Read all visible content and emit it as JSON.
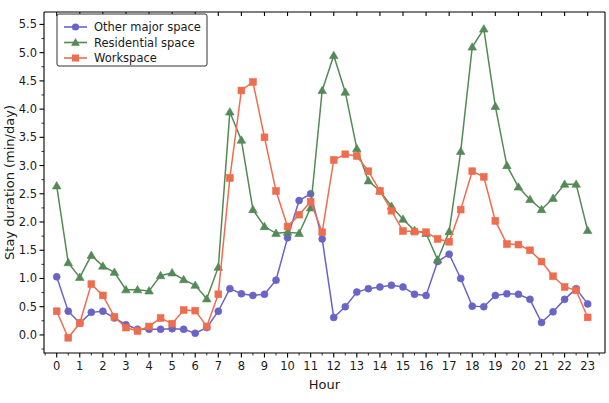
{
  "chart_data": {
    "type": "line",
    "title": "",
    "xlabel": "Hour",
    "ylabel": "Stay duration (min/day)",
    "xlim": [
      -0.55,
      23.75
    ],
    "ylim": [
      -0.32,
      5.72
    ],
    "grid": false,
    "legend_position": "upper left",
    "xticks": [
      0,
      1,
      2,
      3,
      4,
      5,
      6,
      7,
      8,
      9,
      10,
      11,
      12,
      13,
      14,
      15,
      16,
      17,
      18,
      19,
      20,
      21,
      22,
      23
    ],
    "xtick_labels": [
      "0",
      "1",
      "2",
      "3",
      "4",
      "5",
      "6",
      "7",
      "8",
      "9",
      "10",
      "11",
      "12",
      "13",
      "14",
      "15",
      "16",
      "17",
      "18",
      "19",
      "20",
      "21",
      "22",
      "23"
    ],
    "yticks": [
      0.0,
      0.5,
      1.0,
      1.5,
      2.0,
      2.5,
      3.0,
      3.5,
      4.0,
      4.5,
      5.0,
      5.5
    ],
    "ytick_labels": [
      "0.0",
      "0.5",
      "1.0",
      "1.5",
      "2.0",
      "2.5",
      "3.0",
      "3.5",
      "4.0",
      "4.5",
      "5.0",
      "5.5"
    ],
    "x": [
      0,
      0.5,
      1,
      1.5,
      2,
      2.5,
      3,
      3.5,
      4,
      4.5,
      5,
      5.5,
      6,
      6.5,
      7,
      7.5,
      8,
      8.5,
      9,
      9.5,
      10,
      10.5,
      11,
      11.5,
      12,
      12.5,
      13,
      13.5,
      14,
      14.5,
      15,
      15.5,
      16,
      16.5,
      17,
      17.5,
      18,
      18.5,
      19,
      19.5,
      20,
      20.5,
      21,
      21.5,
      22,
      22.5,
      23
    ],
    "series": [
      {
        "name": "Other major space",
        "color": "#6A63C8",
        "marker": "circle",
        "values": [
          1.03,
          0.42,
          0.21,
          0.4,
          0.42,
          0.3,
          0.18,
          0.1,
          0.1,
          0.1,
          0.11,
          0.1,
          0.03,
          0.13,
          0.42,
          0.82,
          0.73,
          0.7,
          0.72,
          0.97,
          1.72,
          2.38,
          2.5,
          1.7,
          0.31,
          0.5,
          0.76,
          0.82,
          0.85,
          0.88,
          0.85,
          0.72,
          0.7,
          1.3,
          1.43,
          1.0,
          0.51,
          0.5,
          0.7,
          0.73,
          0.72,
          0.63,
          0.22,
          0.41,
          0.63,
          0.82,
          0.55
        ]
      },
      {
        "name": "Residential space",
        "color": "#538A55",
        "marker": "triangle",
        "values": [
          2.64,
          1.28,
          1.02,
          1.41,
          1.22,
          1.11,
          0.8,
          0.8,
          0.78,
          1.05,
          1.1,
          0.98,
          0.88,
          0.64,
          1.2,
          3.95,
          3.45,
          2.22,
          1.92,
          1.8,
          1.82,
          1.8,
          2.25,
          4.33,
          4.95,
          4.3,
          3.3,
          2.73,
          2.55,
          2.28,
          2.05,
          1.85,
          1.8,
          1.33,
          1.83,
          3.25,
          5.1,
          5.42,
          4.05,
          3.0,
          2.62,
          2.4,
          2.22,
          2.42,
          2.67,
          2.67,
          1.85
        ]
      },
      {
        "name": "Workspace",
        "color": "#EE6D4E",
        "marker": "square",
        "values": [
          0.42,
          -0.05,
          0.21,
          0.9,
          0.7,
          0.32,
          0.13,
          0.07,
          0.15,
          0.3,
          0.2,
          0.44,
          0.43,
          0.15,
          0.72,
          2.78,
          4.33,
          4.48,
          3.5,
          2.55,
          1.92,
          2.13,
          2.36,
          1.82,
          3.1,
          3.2,
          3.17,
          2.9,
          2.55,
          2.2,
          1.84,
          1.83,
          1.82,
          1.7,
          1.65,
          2.22,
          2.9,
          2.8,
          2.02,
          1.61,
          1.6,
          1.5,
          1.3,
          1.04,
          0.85,
          0.79,
          0.31
        ]
      }
    ]
  },
  "legend": {
    "entries": [
      {
        "label": "Other major space"
      },
      {
        "label": "Residential space"
      },
      {
        "label": "Workspace"
      }
    ]
  }
}
